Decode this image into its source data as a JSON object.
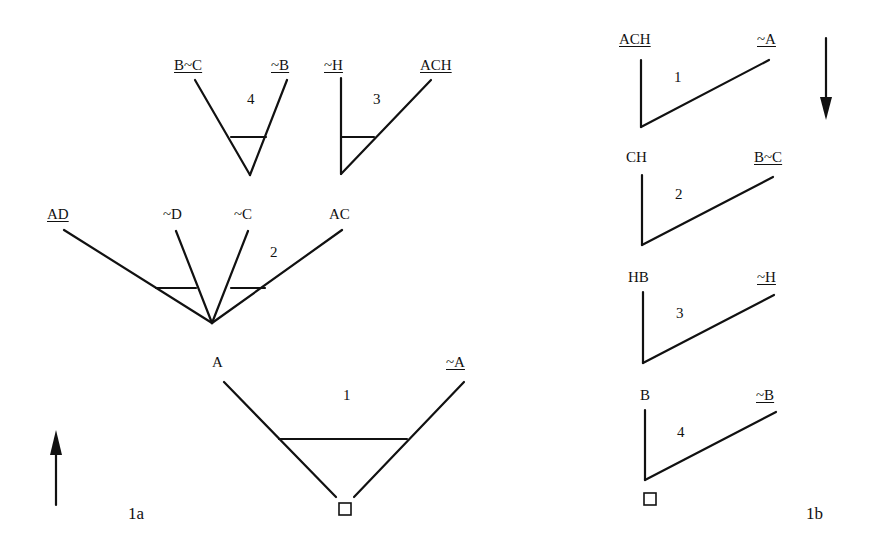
{
  "figure_1a": {
    "caption": "1a",
    "direction_arrow": "up",
    "trees": [
      {
        "step": "1",
        "left_label": "A",
        "left_underlined": false,
        "right_label": "~A",
        "right_underlined": true,
        "root": "□"
      },
      {
        "step": "2",
        "labels": [
          "AD",
          "~D",
          "~C",
          "AC"
        ],
        "underlined": [
          "AD"
        ]
      },
      {
        "step": "3",
        "left_label": "~H",
        "left_underlined": true,
        "right_label": "ACH",
        "right_underlined": true
      },
      {
        "step": "4",
        "left_label": "B~C",
        "left_underlined": true,
        "right_label": "~B",
        "right_underlined": true
      }
    ]
  },
  "figure_1b": {
    "caption": "1b",
    "direction_arrow": "down",
    "steps": [
      {
        "step": "1",
        "left_label": "ACH",
        "left_underlined": true,
        "right_label": "~A",
        "right_underlined": true
      },
      {
        "step": "2",
        "left_label": "CH",
        "left_underlined": false,
        "right_label": "B~C",
        "right_underlined": true
      },
      {
        "step": "3",
        "left_label": "HB",
        "left_underlined": false,
        "right_label": "~H",
        "right_underlined": true
      },
      {
        "step": "4",
        "left_label": "B",
        "left_underlined": false,
        "right_label": "~B",
        "right_underlined": true
      }
    ],
    "root": "□"
  }
}
